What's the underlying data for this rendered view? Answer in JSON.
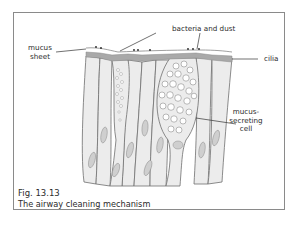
{
  "figure": {
    "number": "Fig. 13.13",
    "caption": "The airway cleaning mechanism"
  },
  "labels": {
    "mucus_sheet_line1": "mucus",
    "mucus_sheet_line2": "sheet",
    "bacteria_and_dust": "bacteria and dust",
    "cilia": "cilia",
    "mucus_secreting_cell_line1": "mucus-",
    "mucus_secreting_cell_line2": "secreting",
    "mucus_secreting_cell_line3": "cell"
  },
  "colors": {
    "frame": "#8a8a8a",
    "cell_fill": "#ececec",
    "cell_outline": "#6e6e6e",
    "nucleus": "#cfcfcf",
    "cilia_band": "#a9a9a9",
    "leader_line": "#333333"
  }
}
